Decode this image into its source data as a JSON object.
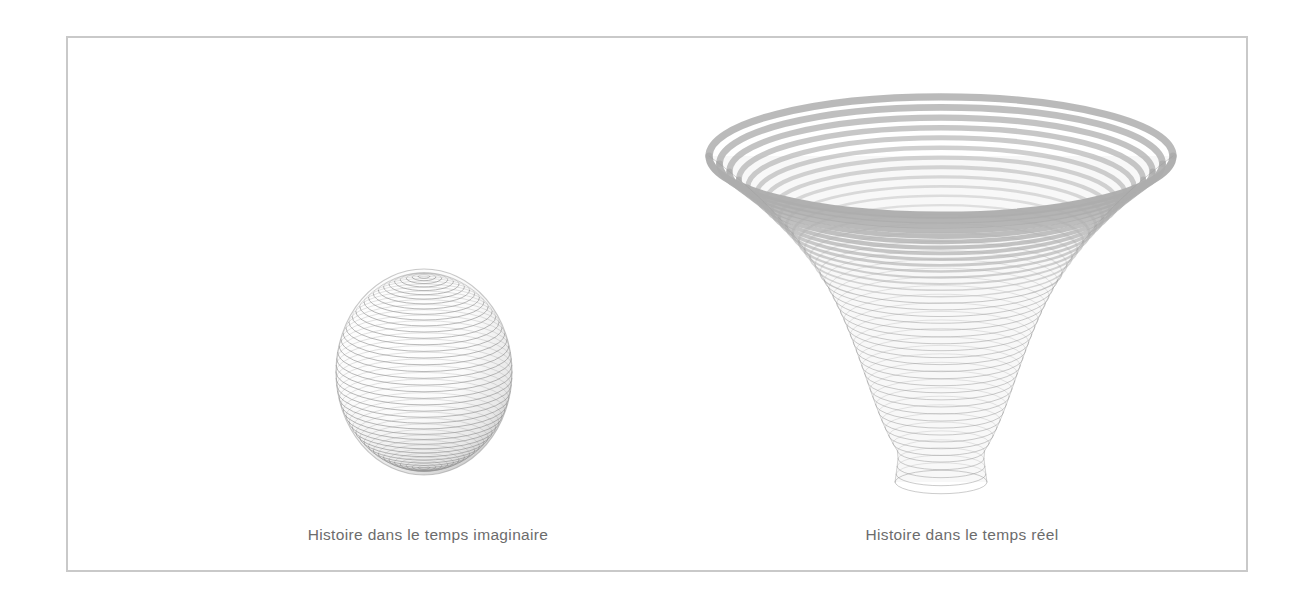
{
  "page": {
    "background_color": "#ffffff",
    "width": 1306,
    "height": 604
  },
  "frame": {
    "border_color": "#c9c9c9",
    "border_width_px": 2
  },
  "figures": [
    {
      "id": "imaginary-time-history",
      "caption": "Histoire dans le temps imaginaire",
      "shape": "sphere",
      "render": "wireframe-latitude-rings",
      "line_color": "#8f8f8f",
      "center_x": 358,
      "center_y": 336,
      "radius_x": 88,
      "radius_y": 103,
      "ring_count": 46,
      "view_tilt": 0.3
    },
    {
      "id": "real-time-history",
      "caption": "Histoire dans le temps réel",
      "shape": "flared-bowl",
      "render": "wireframe-stacked-ellipses",
      "line_color": "#8f8f8f",
      "rim_color": "#adadad",
      "center_x": 875,
      "top_y": 120,
      "bottom_y": 446,
      "rim_radius_x": 232,
      "bottom_radius_x": 92,
      "ellipse_flatten": 0.255,
      "ring_count": 42
    }
  ],
  "chart_data": {
    "type": "line",
    "title": "",
    "subtitle": "",
    "xlabel": "",
    "ylabel": "",
    "annotations": [
      "Histoire dans le temps imaginaire",
      "Histoire dans le temps réel"
    ],
    "series": [
      {
        "name": "Histoire dans le temps imaginaire",
        "description": "Sphere: radius of universe vs imaginary time, closed surface with no boundary",
        "x": [
          0.0,
          0.1,
          0.2,
          0.3,
          0.4,
          0.5,
          0.6,
          0.7,
          0.8,
          0.9,
          1.0
        ],
        "values": [
          0.0,
          0.59,
          0.8,
          0.92,
          0.98,
          1.0,
          0.98,
          0.92,
          0.8,
          0.59,
          0.0
        ]
      },
      {
        "name": "Histoire dans le temps réel",
        "description": "Flared bowl: radius of universe expanding with real time",
        "x": [
          0.0,
          0.1,
          0.2,
          0.3,
          0.4,
          0.5,
          0.6,
          0.7,
          0.8,
          0.9,
          1.0
        ],
        "values": [
          0.39,
          0.4,
          0.43,
          0.48,
          0.55,
          0.63,
          0.72,
          0.82,
          0.9,
          0.96,
          1.0
        ]
      }
    ],
    "legend_position": "below",
    "grid": false
  }
}
